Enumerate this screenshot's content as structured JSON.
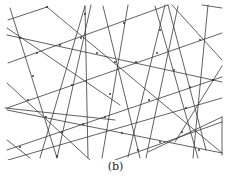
{
  "figure": {
    "caption": "(b)",
    "stroke_color": "#3a3a3a",
    "background": "#ffffff",
    "segments": [
      [
        8,
        20,
        47,
        7
      ],
      [
        47,
        7,
        222,
        153
      ],
      [
        8,
        63,
        168,
        5
      ],
      [
        7,
        28,
        120,
        105
      ],
      [
        7,
        83,
        90,
        160
      ],
      [
        7,
        140,
        30,
        158
      ],
      [
        10,
        8,
        57,
        158
      ],
      [
        7,
        108,
        222,
        33
      ],
      [
        7,
        150,
        222,
        77
      ],
      [
        7,
        110,
        222,
        153
      ],
      [
        7,
        35,
        222,
        82
      ],
      [
        8,
        160,
        222,
        98
      ],
      [
        115,
        160,
        222,
        122
      ],
      [
        85,
        6,
        40,
        158
      ],
      [
        85,
        6,
        88,
        158
      ],
      [
        91,
        5,
        57,
        158
      ],
      [
        128,
        5,
        102,
        158
      ],
      [
        103,
        6,
        140,
        158
      ],
      [
        155,
        6,
        198,
        158
      ],
      [
        165,
        5,
        128,
        157
      ],
      [
        172,
        5,
        222,
        60
      ],
      [
        178,
        6,
        146,
        158
      ],
      [
        208,
        5,
        193,
        158
      ],
      [
        202,
        5,
        222,
        8
      ],
      [
        222,
        66,
        175,
        142
      ],
      [
        222,
        117,
        222,
        155
      ],
      [
        148,
        152,
        222,
        117
      ],
      [
        5,
        108,
        115,
        120
      ],
      [
        168,
        5,
        206,
        150
      ]
    ],
    "nodes": [
      [
        47,
        7
      ],
      [
        85,
        14
      ],
      [
        124,
        23
      ],
      [
        20,
        38
      ],
      [
        60,
        45
      ],
      [
        37,
        53
      ],
      [
        97,
        53
      ],
      [
        81,
        38
      ],
      [
        160,
        30
      ],
      [
        200,
        40
      ],
      [
        115,
        62
      ],
      [
        136,
        62
      ],
      [
        157,
        53
      ],
      [
        174,
        70
      ],
      [
        33,
        76
      ],
      [
        72,
        85
      ],
      [
        213,
        80
      ],
      [
        190,
        87
      ],
      [
        110,
        94
      ],
      [
        149,
        100
      ],
      [
        28,
        100
      ],
      [
        46,
        117
      ],
      [
        105,
        117
      ],
      [
        186,
        108
      ],
      [
        62,
        132
      ],
      [
        122,
        133
      ],
      [
        182,
        132
      ],
      [
        83,
        124
      ],
      [
        160,
        142
      ],
      [
        138,
        150
      ],
      [
        20,
        147
      ],
      [
        57,
        156
      ],
      [
        199,
        150
      ]
    ]
  }
}
